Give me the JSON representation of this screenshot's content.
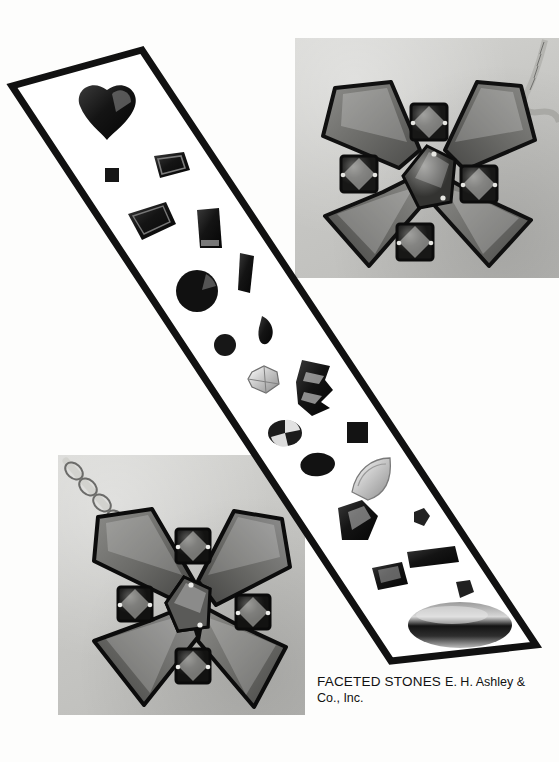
{
  "page": {
    "background_color": "#fdfdfc",
    "width": 559,
    "height": 762,
    "media": "halftone print page",
    "ink_color": "#111111"
  },
  "caption": {
    "title": "FACETED STONES",
    "company_line1": "E. H. Ashley &",
    "company_line2": "Co., Inc."
  },
  "photos": [
    {
      "name": "top-right-brooch-photo",
      "subject": "X-shaped faceted stone brooch with chain",
      "x": 295,
      "y": 38,
      "width": 264,
      "height": 240,
      "paper_tone": "#cbcbc8"
    },
    {
      "name": "bottom-left-pendant-photo",
      "subject": "X-shaped faceted stone pendant with chain",
      "x": 58,
      "y": 455,
      "width": 247,
      "height": 260,
      "paper_tone": "#c9c9c6"
    }
  ],
  "strip": {
    "name": "diagonal-stone-strip",
    "border_color": "#111111",
    "fill_color": "#ffffff",
    "corners": [
      [
        142,
        50
      ],
      [
        12,
        86
      ],
      [
        391,
        661
      ],
      [
        536,
        645
      ]
    ],
    "stones": [
      {
        "shape": "heart",
        "label": "heart cut",
        "cx": 107,
        "cy": 113,
        "w": 54,
        "h": 52,
        "tone": "#141414"
      },
      {
        "shape": "square-small",
        "label": "small square step",
        "cx": 112,
        "cy": 175,
        "w": 13,
        "h": 13,
        "tone": "#161616"
      },
      {
        "shape": "emerald",
        "label": "emerald cut",
        "cx": 170,
        "cy": 164,
        "w": 38,
        "h": 27,
        "tone": "#1d1d1d"
      },
      {
        "shape": "trapezoid",
        "label": "trapezoid cut",
        "cx": 150,
        "cy": 221,
        "w": 48,
        "h": 38,
        "tone": "#1f1f1f"
      },
      {
        "shape": "tapered",
        "label": "tapered baguette",
        "cx": 208,
        "cy": 228,
        "w": 26,
        "h": 38,
        "tone": "#1a1a1a"
      },
      {
        "shape": "round-large",
        "label": "round brilliant",
        "cx": 197,
        "cy": 291,
        "w": 42,
        "h": 42,
        "tone": "#111111"
      },
      {
        "shape": "baguette",
        "label": "baguette",
        "cx": 246,
        "cy": 273,
        "w": 18,
        "h": 40,
        "tone": "#1e1e1e"
      },
      {
        "shape": "marquise",
        "label": "marquise",
        "cx": 268,
        "cy": 329,
        "w": 22,
        "h": 26,
        "tone": "#1b1b1b"
      },
      {
        "shape": "round-small",
        "label": "small round",
        "cx": 225,
        "cy": 345,
        "w": 22,
        "h": 22,
        "tone": "#171717"
      },
      {
        "shape": "star",
        "label": "star / fantasy cut",
        "cx": 264,
        "cy": 380,
        "w": 30,
        "h": 26,
        "tone": "#9a9a9a"
      },
      {
        "shape": "fan",
        "label": "fan fantasy cut",
        "cx": 313,
        "cy": 386,
        "w": 36,
        "h": 54,
        "tone": "#141414"
      },
      {
        "shape": "oval-pie",
        "label": "oval brilliant",
        "cx": 285,
        "cy": 433,
        "w": 32,
        "h": 25,
        "tone": "#1c1c1c"
      },
      {
        "shape": "square-step",
        "label": "square step cut",
        "cx": 357,
        "cy": 432,
        "w": 20,
        "h": 20,
        "tone": "#131313"
      },
      {
        "shape": "pear",
        "label": "pear cut",
        "cx": 318,
        "cy": 463,
        "w": 34,
        "h": 24,
        "tone": "#121212"
      },
      {
        "shape": "trilliant",
        "label": "trilliant",
        "cx": 371,
        "cy": 476,
        "w": 42,
        "h": 38,
        "tone": "#c2c2c2"
      },
      {
        "shape": "kite",
        "label": "pentagon / kite",
        "cx": 357,
        "cy": 523,
        "w": 42,
        "h": 40,
        "tone": "#1a1a1a"
      },
      {
        "shape": "bowtie",
        "label": "small fancy cut",
        "cx": 422,
        "cy": 518,
        "w": 18,
        "h": 18,
        "tone": "#222222"
      },
      {
        "shape": "long-bag",
        "label": "long baguette",
        "cx": 432,
        "cy": 557,
        "w": 52,
        "h": 17,
        "tone": "#161616"
      },
      {
        "shape": "shield",
        "label": "shield cut",
        "cx": 390,
        "cy": 577,
        "w": 38,
        "h": 28,
        "tone": "#191919"
      },
      {
        "shape": "chip",
        "label": "small fancy chip",
        "cx": 464,
        "cy": 590,
        "w": 20,
        "h": 18,
        "tone": "#202020"
      },
      {
        "shape": "cabochon",
        "label": "oval cabochon",
        "cx": 460,
        "cy": 625,
        "w": 104,
        "h": 46,
        "tone": "#2b2b2b"
      }
    ]
  }
}
